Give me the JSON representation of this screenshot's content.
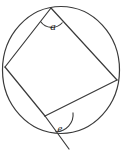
{
  "figure": {
    "kind": "geometry-diagram",
    "stroke_color": "#3a3a3a",
    "fill_color": "none",
    "background_color": "#ffffff",
    "stroke_width": 1.1,
    "circle": {
      "name": "circumscribed-circle",
      "cx": 61,
      "cy": 70,
      "r": 58.5,
      "ry": 63.5
    },
    "vertices": [
      {
        "name": "vertex-top",
        "label": "",
        "x": 51,
        "y": 8
      },
      {
        "name": "vertex-left",
        "label": "",
        "x": 5,
        "y": 67
      },
      {
        "name": "vertex-bottom",
        "label": "",
        "x": 45,
        "y": 116
      },
      {
        "name": "vertex-right",
        "label": "",
        "x": 117,
        "y": 80
      }
    ],
    "chords": [
      {
        "name": "chord-top-left",
        "x1": 51,
        "y1": 8,
        "x2": 5,
        "y2": 67
      },
      {
        "name": "chord-left-bottom",
        "x1": 5,
        "y1": 67,
        "x2": 45,
        "y2": 116
      },
      {
        "name": "chord-bottom-right",
        "x1": 45,
        "y1": 116,
        "x2": 117,
        "y2": 80
      },
      {
        "name": "chord-right-top",
        "x1": 117,
        "y1": 80,
        "x2": 51,
        "y2": 8
      }
    ],
    "extension": {
      "name": "extended-side-ray",
      "x1": 45,
      "y1": 116,
      "x2": 69,
      "y2": 149
    },
    "angles": [
      {
        "name": "angle-a",
        "label": "a",
        "at_vertex": "vertex-top",
        "label_x": 53,
        "label_y": 30,
        "arc_path": "M 40.5 21.5 A 14 14 0 0 0 62.5 22.5",
        "type": "interior"
      },
      {
        "name": "angle-e",
        "label": "e",
        "at_vertex": "vertex-bottom",
        "label_x": 58,
        "label_y": 132,
        "arc_path": "M 73 112.5 A 16 16 0 0 1 55.5 131",
        "type": "exterior"
      }
    ]
  }
}
